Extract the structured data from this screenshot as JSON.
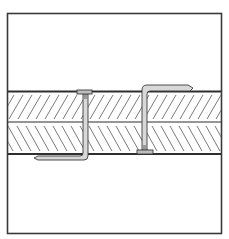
{
  "diagram": {
    "type": "technical-cross-section",
    "colors": {
      "background": "#ffffff",
      "frame": "#3a3a3a",
      "layer_line": "#2e2e2e",
      "hatch": "#6a6a6a",
      "nail_fill": "#d8d8d8",
      "nail_stroke": "#3a3a3a"
    },
    "frame": {
      "x": 7,
      "y": 13,
      "width": 215,
      "height": 221
    },
    "layers": [
      {
        "name": "upper-board",
        "top": 91,
        "bottom": 122,
        "hatch_direction": "forward-slash"
      },
      {
        "name": "lower-board",
        "top": 122,
        "bottom": 154,
        "hatch_direction": "back-slash"
      }
    ],
    "nails": [
      {
        "name": "left-nail",
        "head": {
          "x": 77,
          "y": 91,
          "width": 14,
          "height": 3
        },
        "shank_x": 85,
        "clinch": "bent under lower face, tip pointing left",
        "clinch_end_x": 35,
        "clinch_y": 157
      },
      {
        "name": "right-nail",
        "head": {
          "x": 137,
          "y": 150,
          "width": 16,
          "height": 4
        },
        "shank_x": 144,
        "clinch": "bent over upper face, tip pointing right",
        "clinch_end_x": 192,
        "clinch_y": 87
      }
    ]
  }
}
